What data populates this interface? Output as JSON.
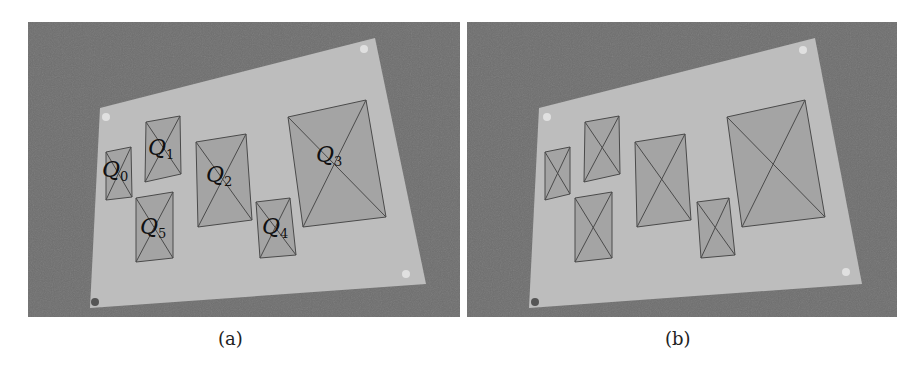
{
  "figure": {
    "panels": [
      {
        "id": "a",
        "caption": "(a)",
        "labels": [
          {
            "name": "Q",
            "sub": "0"
          },
          {
            "name": "Q",
            "sub": "1"
          },
          {
            "name": "Q",
            "sub": "2"
          },
          {
            "name": "Q",
            "sub": "3"
          },
          {
            "name": "Q",
            "sub": "4"
          },
          {
            "name": "Q",
            "sub": "5"
          }
        ]
      },
      {
        "id": "b",
        "caption": "(b)"
      }
    ],
    "colors": {
      "background": "#6e6e6e",
      "board": "#bdbdbd",
      "quad_fill": "#9f9f9f",
      "quad_stroke": "#4a4a4a",
      "pin": "#e0e0e0"
    }
  }
}
